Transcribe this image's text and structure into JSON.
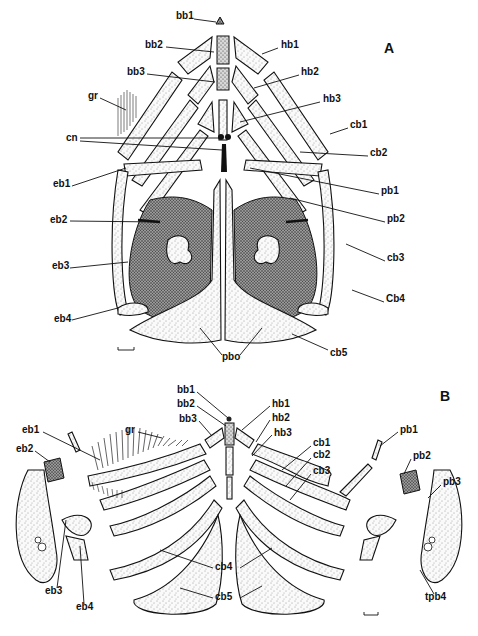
{
  "figure": {
    "panels": [
      {
        "id": "A",
        "label": "A",
        "labels": [
          {
            "text": "bb1",
            "x": 176,
            "y": 15
          },
          {
            "text": "bb2",
            "x": 145,
            "y": 44
          },
          {
            "text": "hb1",
            "x": 281,
            "y": 44
          },
          {
            "text": "bb3",
            "x": 127,
            "y": 71
          },
          {
            "text": "hb2",
            "x": 301,
            "y": 71
          },
          {
            "text": "gr",
            "x": 88,
            "y": 95
          },
          {
            "text": "hb3",
            "x": 323,
            "y": 98
          },
          {
            "text": "cb1",
            "x": 350,
            "y": 124
          },
          {
            "text": "cn",
            "x": 66,
            "y": 137
          },
          {
            "text": "cb2",
            "x": 370,
            "y": 152
          },
          {
            "text": "eb1",
            "x": 53,
            "y": 183
          },
          {
            "text": "pb1",
            "x": 381,
            "y": 190
          },
          {
            "text": "pb2",
            "x": 387,
            "y": 218
          },
          {
            "text": "eb2",
            "x": 50,
            "y": 219
          },
          {
            "text": "eb3",
            "x": 52,
            "y": 265
          },
          {
            "text": "cb3",
            "x": 387,
            "y": 257
          },
          {
            "text": "Cb4",
            "x": 386,
            "y": 298
          },
          {
            "text": "eb4",
            "x": 54,
            "y": 318
          },
          {
            "text": "pbo",
            "x": 222,
            "y": 356
          },
          {
            "text": "cb5",
            "x": 330,
            "y": 352
          }
        ]
      },
      {
        "id": "B",
        "label": "B",
        "labels": [
          {
            "text": "bb1",
            "x": 177,
            "y": 389
          },
          {
            "text": "bb2",
            "x": 177,
            "y": 403
          },
          {
            "text": "hb1",
            "x": 272,
            "y": 403
          },
          {
            "text": "bb3",
            "x": 179,
            "y": 418
          },
          {
            "text": "hb2",
            "x": 272,
            "y": 417
          },
          {
            "text": "hb3",
            "x": 274,
            "y": 432
          },
          {
            "text": "eb1",
            "x": 22,
            "y": 429
          },
          {
            "text": "gr",
            "x": 125,
            "y": 429
          },
          {
            "text": "pb1",
            "x": 400,
            "y": 429
          },
          {
            "text": "cb1",
            "x": 313,
            "y": 442
          },
          {
            "text": "eb2",
            "x": 16,
            "y": 448
          },
          {
            "text": "cb2",
            "x": 313,
            "y": 454
          },
          {
            "text": "pb2",
            "x": 413,
            "y": 455
          },
          {
            "text": "cb3",
            "x": 313,
            "y": 470
          },
          {
            "text": "pb3",
            "x": 443,
            "y": 481
          },
          {
            "text": "cb4",
            "x": 215,
            "y": 566
          },
          {
            "text": "eb3",
            "x": 45,
            "y": 590
          },
          {
            "text": "cb5",
            "x": 215,
            "y": 596
          },
          {
            "text": "tpb4",
            "x": 425,
            "y": 596
          },
          {
            "text": "eb4",
            "x": 76,
            "y": 606
          }
        ]
      }
    ],
    "scale_bars": [
      {
        "panel": "A",
        "x": 118,
        "y": 347,
        "width": 16
      },
      {
        "panel": "B",
        "x": 364,
        "y": 612,
        "width": 14
      }
    ]
  }
}
